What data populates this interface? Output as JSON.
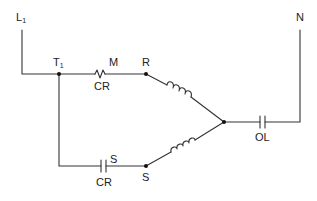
{
  "diagram": {
    "type": "motor starting circuit (capacitor-start, current relay)",
    "colors": {
      "line": "#333333",
      "background": "#ffffff"
    },
    "labels": {
      "line": {
        "main": "L",
        "sub": "1"
      },
      "neutral": "N",
      "terminal": {
        "main": "T",
        "sub": "1"
      },
      "run_contact_label": "M",
      "run_relay_label": "CR",
      "run_node": "R",
      "start_contact_label": "S",
      "start_relay_label": "CR",
      "start_node": "S",
      "overload": "OL"
    },
    "components": [
      {
        "id": "relay-coil-M",
        "kind": "relay coil (zigzag)",
        "labels": [
          "M",
          "CR"
        ]
      },
      {
        "id": "relay-contact-S",
        "kind": "normally-open contact",
        "labels": [
          "S",
          "CR"
        ]
      },
      {
        "id": "run-winding",
        "kind": "inductor winding",
        "from": "R",
        "to": "common"
      },
      {
        "id": "start-winding",
        "kind": "inductor winding",
        "from": "S",
        "to": "common"
      },
      {
        "id": "overload",
        "kind": "normally-closed overload contact",
        "labels": [
          "OL"
        ]
      }
    ]
  }
}
